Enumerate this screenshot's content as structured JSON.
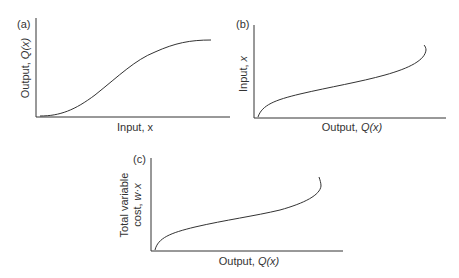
{
  "panels": [
    {
      "id": "a",
      "label": "(a)",
      "xlabel": "Input, x",
      "ylabel_prefix": "Output, ",
      "ylabel_var": "Q(x)",
      "curve": "S-shaped production function rising and flattening"
    },
    {
      "id": "b",
      "label": "(b)",
      "xlabel_prefix": "Output, ",
      "xlabel_var": "Q(x)",
      "ylabel_prefix": "Input, ",
      "ylabel_var": "x",
      "curve": "inverse of production function"
    },
    {
      "id": "c",
      "label": "(c)",
      "xlabel_prefix": "Output, ",
      "xlabel_var": "Q(x)",
      "ylabel_line1": "Total variable",
      "ylabel_line2_prefix": "cost, ",
      "ylabel_line2_var": "w·x",
      "curve": "total variable cost curve"
    }
  ],
  "colors": {
    "axis": "#333333",
    "curve": "#333333"
  }
}
